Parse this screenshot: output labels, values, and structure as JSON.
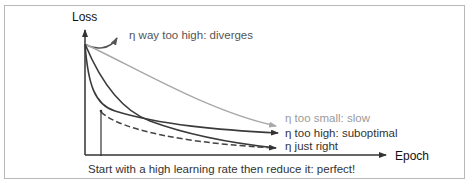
{
  "diagram": {
    "y_axis_label": "Loss",
    "x_axis_label": "Epoch",
    "curves": [
      {
        "id": "diverges",
        "label": "η way too high: diverges",
        "color": "#555555",
        "style": "solid"
      },
      {
        "id": "too_small",
        "label": "η too small: slow",
        "color": "#a8a8a8",
        "style": "solid"
      },
      {
        "id": "too_high",
        "label": "η too high: suboptimal",
        "color": "#3a3a3a",
        "style": "solid"
      },
      {
        "id": "just_right",
        "label": "η just right",
        "color": "#3a3a3a",
        "style": "solid"
      },
      {
        "id": "schedule",
        "label": "",
        "color": "#444444",
        "style": "dashed"
      }
    ],
    "caption": "Start with a high learning rate then reduce it: perfect!"
  }
}
